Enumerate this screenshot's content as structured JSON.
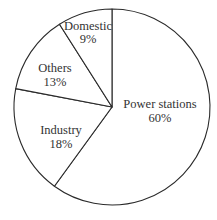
{
  "chart_data": {
    "type": "pie",
    "title": "",
    "start_angle_deg": 0,
    "direction": "clockwise",
    "legend": "none (labels inside slices)",
    "slices": [
      {
        "label": "Power stations",
        "value": 60,
        "value_label": "60%"
      },
      {
        "label": "Industry",
        "value": 18,
        "value_label": "18%"
      },
      {
        "label": "Others",
        "value": 13,
        "value_label": "13%"
      },
      {
        "label": "Domestic",
        "value": 9,
        "value_label": "9%"
      }
    ],
    "categories": [
      "Power stations",
      "Industry",
      "Others",
      "Domestic"
    ],
    "values": [
      60,
      18,
      13,
      9
    ],
    "colors": {
      "fill": "#ffffff",
      "stroke": "#2a2a2a",
      "text": "#333333"
    }
  },
  "geometry": {
    "cx": 112,
    "cy": 107,
    "r": 98
  },
  "label_positions": [
    {
      "x": 160,
      "y": 108,
      "dy": 14
    },
    {
      "x": 61,
      "y": 134,
      "dy": 14
    },
    {
      "x": 55,
      "y": 72,
      "dy": 14
    },
    {
      "x": 88,
      "y": 30,
      "dy": 13
    }
  ]
}
